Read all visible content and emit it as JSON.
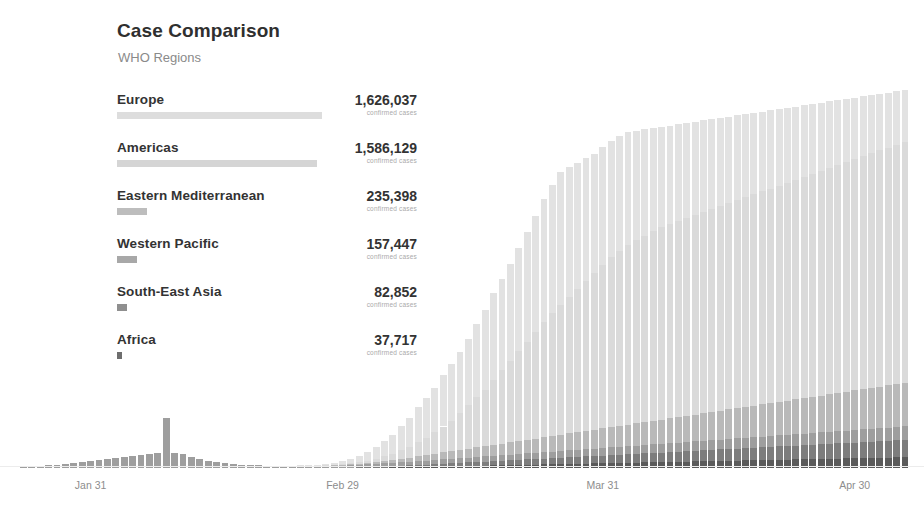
{
  "header": {
    "title": "Case Comparison",
    "subtitle": "WHO Regions"
  },
  "legend": {
    "value_caption": "confirmed cases",
    "items": [
      {
        "name": "Europe",
        "value": "1,626,037",
        "count": 1626037,
        "caption": "confirmed cases",
        "color": "#dddddd"
      },
      {
        "name": "Americas",
        "value": "1,586,129",
        "count": 1586129,
        "caption": "confirmed cases",
        "color": "#d5d5d5"
      },
      {
        "name": "Eastern Mediterranean",
        "value": "235,398",
        "count": 235398,
        "caption": "confirmed cases",
        "color": "#bdbdbd"
      },
      {
        "name": "Western Pacific",
        "value": "157,447",
        "count": 157447,
        "caption": "confirmed cases",
        "color": "#a8a8a8"
      },
      {
        "name": "South-East Asia",
        "value": "82,852",
        "count": 82852,
        "caption": "confirmed cases",
        "color": "#8f8f8f"
      },
      {
        "name": "Africa",
        "value": "37,717",
        "count": 37717,
        "caption": "confirmed cases",
        "color": "#6e6e6e"
      }
    ]
  },
  "chart_data": {
    "type": "bar",
    "stacked": true,
    "title": "Case Comparison",
    "subtitle": "WHO Regions",
    "xlabel": "",
    "ylabel": "",
    "grid": false,
    "legend_position": "left-list",
    "tick_labels": [
      "Jan 31",
      "Feb 29",
      "Mar 31",
      "Apr 30"
    ],
    "tick_indices": [
      8,
      38,
      69,
      99
    ],
    "x_start": "Jan 23",
    "x_end": "May 06",
    "ylim": [
      0,
      110000
    ],
    "series": [
      {
        "name": "Europe",
        "color": "#e2e2e2",
        "values": [
          0,
          0,
          0,
          0,
          0,
          0,
          0,
          0,
          0,
          0,
          0,
          0,
          0,
          0,
          0,
          0,
          0,
          0,
          0,
          0,
          0,
          0,
          0,
          0,
          0,
          0,
          0,
          0,
          0,
          0,
          0,
          0,
          0,
          100,
          160,
          240,
          420,
          600,
          900,
          1200,
          1900,
          2600,
          3600,
          4600,
          5600,
          7200,
          8800,
          10500,
          12000,
          13500,
          15500,
          17000,
          18500,
          20000,
          22000,
          24000,
          26000,
          27500,
          29000,
          31000,
          33000,
          35000,
          37000,
          38500,
          40000,
          39000,
          38000,
          37000,
          36000,
          35500,
          35000,
          34500,
          34000,
          33000,
          32000,
          31000,
          30000,
          29500,
          29000,
          28500,
          28000,
          27500,
          27000,
          26500,
          26000,
          25500,
          25000,
          24500,
          24000,
          23500,
          23000,
          22500,
          22000,
          21500,
          21000,
          20500,
          20000,
          19500,
          19000,
          18500,
          18000,
          17500,
          17000,
          16500,
          16000,
          15500
        ]
      },
      {
        "name": "Americas",
        "color": "#dadada",
        "values": [
          0,
          0,
          0,
          0,
          0,
          0,
          0,
          0,
          0,
          0,
          0,
          0,
          0,
          0,
          0,
          0,
          0,
          0,
          0,
          0,
          0,
          0,
          0,
          0,
          0,
          0,
          0,
          0,
          0,
          0,
          0,
          0,
          0,
          20,
          30,
          50,
          90,
          140,
          220,
          320,
          500,
          700,
          1000,
          1400,
          1900,
          2500,
          3200,
          4200,
          5200,
          6400,
          7800,
          9200,
          11000,
          13000,
          15000,
          17000,
          19500,
          22000,
          24500,
          27000,
          29500,
          32000,
          34500,
          37000,
          39000,
          41000,
          43000,
          45000,
          47000,
          49000,
          51000,
          52500,
          54000,
          55000,
          56000,
          57000,
          58000,
          58500,
          59000,
          59500,
          60000,
          60500,
          61000,
          61500,
          62000,
          62500,
          63000,
          63500,
          64000,
          64500,
          65000,
          65500,
          66000,
          66500,
          67000,
          67500,
          68000,
          68500,
          69000,
          69500,
          70000,
          70500,
          71000,
          71500,
          72000,
          72500
        ]
      },
      {
        "name": "Eastern Mediterranean",
        "color": "#b9b9b9",
        "values": [
          0,
          0,
          0,
          0,
          0,
          0,
          0,
          0,
          0,
          0,
          0,
          0,
          0,
          0,
          0,
          0,
          0,
          0,
          0,
          0,
          0,
          0,
          0,
          0,
          0,
          0,
          0,
          0,
          0,
          0,
          0,
          0,
          0,
          20,
          30,
          50,
          80,
          120,
          180,
          250,
          350,
          450,
          600,
          750,
          900,
          1100,
          1300,
          1500,
          1700,
          1900,
          2100,
          2300,
          2500,
          2700,
          2900,
          3100,
          3300,
          3500,
          3700,
          3900,
          4100,
          4300,
          4500,
          4700,
          4900,
          5100,
          5300,
          5500,
          5700,
          5900,
          6100,
          6300,
          6500,
          6700,
          6900,
          7100,
          7300,
          7500,
          7700,
          7900,
          8100,
          8300,
          8500,
          8700,
          8900,
          9100,
          9300,
          9500,
          9700,
          9900,
          10100,
          10300,
          10500,
          10700,
          10900,
          11100,
          11300,
          11500,
          11700,
          11900,
          12100,
          12300,
          12500,
          12700,
          12900,
          13100
        ]
      },
      {
        "name": "Western Pacific",
        "color": "#9e9e9e",
        "values": [
          300,
          400,
          600,
          800,
          1000,
          1200,
          1500,
          1700,
          2000,
          2300,
          2600,
          2900,
          3200,
          3500,
          3800,
          4100,
          4400,
          15000,
          4600,
          4200,
          3400,
          2800,
          2200,
          1800,
          1500,
          1200,
          1000,
          900,
          800,
          700,
          600,
          550,
          500,
          500,
          500,
          550,
          600,
          650,
          700,
          750,
          800,
          850,
          900,
          950,
          1000,
          1050,
          1100,
          1150,
          1200,
          1250,
          1300,
          1350,
          1400,
          1450,
          1500,
          1550,
          1600,
          1650,
          1700,
          1750,
          1800,
          1850,
          1900,
          1950,
          2000,
          2050,
          2100,
          2150,
          2200,
          2250,
          2300,
          2350,
          2400,
          2450,
          2500,
          2550,
          2600,
          2650,
          2700,
          2750,
          2800,
          2850,
          2900,
          2950,
          3000,
          3050,
          3100,
          3150,
          3200,
          3250,
          3300,
          3350,
          3400,
          3450,
          3500,
          3550,
          3600,
          3650,
          3700,
          3750,
          3800,
          3850,
          3900,
          3950,
          4000,
          4050
        ]
      },
      {
        "name": "South-East Asia",
        "color": "#7d7d7d",
        "values": [
          0,
          0,
          0,
          0,
          0,
          0,
          0,
          0,
          0,
          0,
          0,
          0,
          0,
          0,
          0,
          0,
          0,
          0,
          0,
          0,
          0,
          0,
          0,
          0,
          0,
          0,
          0,
          0,
          0,
          0,
          0,
          0,
          0,
          10,
          15,
          20,
          30,
          40,
          60,
          80,
          110,
          150,
          200,
          260,
          330,
          400,
          480,
          560,
          640,
          720,
          800,
          880,
          960,
          1040,
          1120,
          1200,
          1280,
          1360,
          1440,
          1520,
          1600,
          1680,
          1760,
          1840,
          1920,
          2000,
          2080,
          2160,
          2240,
          2320,
          2400,
          2480,
          2560,
          2640,
          2720,
          2800,
          2880,
          2960,
          3040,
          3120,
          3200,
          3280,
          3360,
          3440,
          3520,
          3600,
          3680,
          3760,
          3840,
          3920,
          4000,
          4080,
          4160,
          4240,
          4320,
          4400,
          4480,
          4560,
          4640,
          4720,
          4800,
          4880,
          4960,
          5040,
          5120,
          5200
        ]
      },
      {
        "name": "Africa",
        "color": "#5a5a5a",
        "values": [
          0,
          0,
          0,
          0,
          0,
          0,
          0,
          0,
          0,
          0,
          0,
          0,
          0,
          0,
          0,
          0,
          0,
          0,
          0,
          0,
          0,
          0,
          0,
          0,
          0,
          0,
          0,
          0,
          0,
          0,
          0,
          0,
          0,
          5,
          8,
          12,
          18,
          25,
          35,
          50,
          70,
          90,
          120,
          150,
          190,
          230,
          280,
          330,
          380,
          430,
          480,
          530,
          580,
          630,
          680,
          730,
          780,
          830,
          880,
          930,
          980,
          1030,
          1080,
          1130,
          1180,
          1230,
          1280,
          1330,
          1380,
          1430,
          1480,
          1530,
          1580,
          1630,
          1680,
          1730,
          1780,
          1830,
          1880,
          1930,
          1980,
          2030,
          2080,
          2130,
          2180,
          2230,
          2280,
          2330,
          2380,
          2430,
          2480,
          2530,
          2580,
          2630,
          2680,
          2730,
          2780,
          2830,
          2880,
          2930,
          2980,
          3030,
          3080,
          3130,
          3180,
          3230
        ]
      }
    ]
  }
}
